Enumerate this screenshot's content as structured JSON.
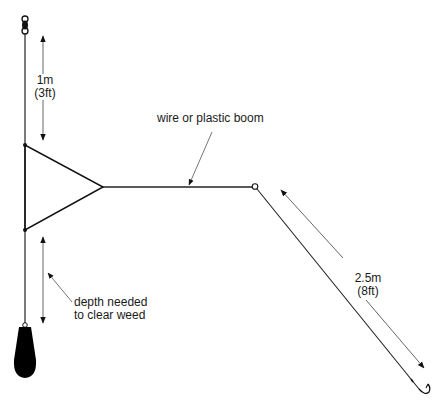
{
  "diagram": {
    "colors": {
      "line": "#111111",
      "dimension": "#555555",
      "weight": "#000000",
      "background": "#ffffff"
    },
    "labels": {
      "upper_length_metric": "1m",
      "upper_length_imperial": "(3ft)",
      "boom": "wire or plastic boom",
      "trace_length_metric": "2.5m",
      "trace_length_imperial": "(8ft)",
      "depth_line1": "depth needed",
      "depth_line2": "to clear weed"
    },
    "components": [
      "swivel",
      "main-line",
      "triangle-boom-frame",
      "boom",
      "boom-ring",
      "hook-trace",
      "hook",
      "lead-weight"
    ]
  }
}
